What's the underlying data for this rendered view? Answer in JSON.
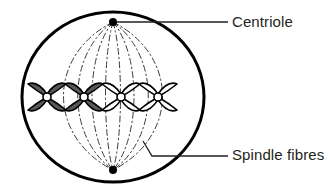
{
  "diagram": {
    "background_color": "#ffffff",
    "cell": {
      "name": "cell-membrane",
      "shape": "ellipse",
      "center_x": 113,
      "center_y": 97,
      "radius_x": 91,
      "radius_y": 85,
      "stroke_color": "#000000",
      "fill_color": "#ffffff",
      "stroke_width": 3
    },
    "centrioles": [
      {
        "name": "centriole-top",
        "position": "top-pole",
        "x": 113,
        "y": 22,
        "radius": 4,
        "color": "#000000"
      },
      {
        "name": "centriole-bottom",
        "position": "bottom-pole",
        "x": 113,
        "y": 170,
        "radius": 4,
        "color": "#000000"
      }
    ],
    "spindle_fibres": {
      "name": "spindle-fibres",
      "count": 8,
      "stroke_color": "#3a3a3a",
      "stroke_width": 1,
      "dash_pattern": "6 3 1.5 3",
      "bulge_offsets": [
        -66,
        -47,
        -28,
        -10,
        10,
        28,
        47,
        66
      ]
    },
    "chromosomes": [
      {
        "name": "chromosome-1",
        "index": 1,
        "center_x": 47,
        "center_y": 97,
        "fill_color": "#595757",
        "stroke_color": "#000000",
        "shade": "dark"
      },
      {
        "name": "chromosome-2",
        "index": 2,
        "center_x": 84,
        "center_y": 97,
        "fill_color": "#595757",
        "stroke_color": "#000000",
        "shade": "dark"
      },
      {
        "name": "chromosome-3",
        "index": 3,
        "center_x": 121,
        "center_y": 97,
        "fill_color": "#ffffff",
        "stroke_color": "#000000",
        "shade": "light"
      },
      {
        "name": "chromosome-4",
        "index": 4,
        "center_x": 158,
        "center_y": 97,
        "fill_color": "#ffffff",
        "stroke_color": "#000000",
        "shade": "light"
      }
    ],
    "centromere": {
      "name": "centromere",
      "fill_color": "#ffffff",
      "stroke_color": "#000000",
      "radius": 4
    }
  },
  "labels": {
    "centriole": {
      "text": "Centriole",
      "text_x": 232,
      "text_y": 27,
      "color": "#231f20",
      "leader": {
        "name": "centriole-leader-line",
        "points": "117,22 228,22",
        "stroke_color": "#231f20",
        "stroke_width": 1.3
      }
    },
    "spindle_fibres": {
      "text": "Spindle fibres",
      "text_x": 232,
      "text_y": 160,
      "color": "#231f20",
      "leader": {
        "name": "spindle-fibres-leader-line",
        "points": "143,141 152,156 228,156",
        "stroke_color": "#231f20",
        "stroke_width": 1.3
      }
    }
  }
}
